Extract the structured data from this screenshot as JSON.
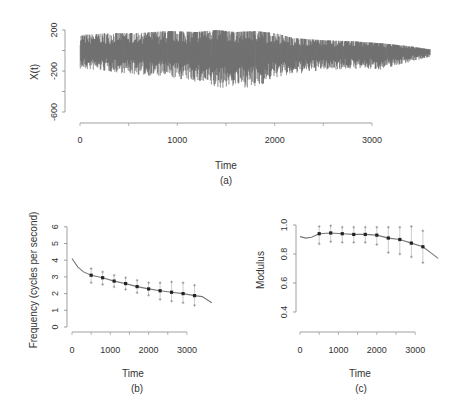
{
  "chart_data": [
    {
      "id": "a",
      "type": "line",
      "caption": "(a)",
      "xlabel": "Time",
      "ylabel": "X(t)",
      "xticks": [
        0,
        1000,
        2000,
        3000
      ],
      "yticks": [
        200,
        -200,
        -600
      ],
      "xlim": [
        0,
        3600
      ],
      "ylim": [
        -650,
        250
      ],
      "description": "Dense oscillating time series, roughly centered near 0, amplitude about ±200 with spikes down to about -500 around t=1400-1800, amplitude shrinking after t=2500",
      "envelope": {
        "x": [
          0,
          300,
          600,
          900,
          1200,
          1400,
          1600,
          1800,
          2000,
          2200,
          2500,
          2800,
          3100,
          3400,
          3600
        ],
        "upper": [
          150,
          170,
          170,
          190,
          180,
          200,
          180,
          190,
          170,
          120,
          100,
          90,
          70,
          40,
          10
        ],
        "lower": [
          -200,
          -230,
          -280,
          -300,
          -380,
          -470,
          -440,
          -470,
          -320,
          -300,
          -240,
          -230,
          -250,
          -150,
          -90
        ]
      }
    },
    {
      "id": "b",
      "type": "line",
      "caption": "(b)",
      "xlabel": "Time",
      "ylabel": "Frequency (cycles per second)",
      "xticks": [
        0,
        1000,
        2000,
        3000
      ],
      "yticks": [
        0,
        1,
        2,
        3,
        4,
        5,
        6
      ],
      "xlim": [
        0,
        3650
      ],
      "ylim": [
        0,
        6
      ],
      "curve": {
        "x": [
          0,
          150,
          300,
          500,
          800,
          1100,
          1400,
          1700,
          2000,
          2300,
          2600,
          2900,
          3200,
          3400,
          3650
        ],
        "y": [
          4.1,
          3.6,
          3.3,
          3.1,
          2.95,
          2.75,
          2.6,
          2.42,
          2.28,
          2.17,
          2.08,
          2.0,
          1.88,
          1.82,
          1.45
        ]
      },
      "points": {
        "x": [
          500,
          800,
          1100,
          1400,
          1700,
          2000,
          2300,
          2600,
          2900,
          3200
        ],
        "y": [
          3.1,
          2.95,
          2.75,
          2.6,
          2.42,
          2.28,
          2.17,
          2.08,
          2.0,
          1.88
        ],
        "upper": [
          3.5,
          3.3,
          3.1,
          2.95,
          2.8,
          2.65,
          2.65,
          2.7,
          2.65,
          2.5
        ],
        "lower": [
          2.65,
          2.55,
          2.4,
          2.25,
          2.05,
          1.9,
          1.65,
          1.55,
          1.45,
          1.3
        ]
      }
    },
    {
      "id": "c",
      "type": "line",
      "caption": "(c)",
      "xlabel": "Time",
      "ylabel": "Modulus",
      "xticks": [
        0,
        1000,
        2000,
        3000
      ],
      "yticks": [
        0.4,
        0.6,
        0.8,
        1.0
      ],
      "ytick_labels": [
        "0.4",
        "0.6",
        "0.8",
        "1.0"
      ],
      "xlim": [
        0,
        3600
      ],
      "ylim": [
        0.4,
        1.0
      ],
      "curve": {
        "x": [
          0,
          150,
          300,
          500,
          800,
          1100,
          1400,
          1700,
          2000,
          2300,
          2600,
          2900,
          3200,
          3400,
          3600
        ],
        "y": [
          0.92,
          0.91,
          0.915,
          0.94,
          0.945,
          0.94,
          0.935,
          0.935,
          0.93,
          0.91,
          0.9,
          0.875,
          0.85,
          0.81,
          0.77
        ]
      },
      "points": {
        "x": [
          500,
          800,
          1100,
          1400,
          1700,
          2000,
          2300,
          2600,
          2900,
          3200
        ],
        "y": [
          0.94,
          0.945,
          0.94,
          0.935,
          0.935,
          0.93,
          0.91,
          0.9,
          0.875,
          0.85
        ],
        "upper": [
          0.99,
          0.995,
          0.985,
          0.985,
          0.985,
          0.985,
          0.985,
          0.985,
          0.99,
          0.96
        ],
        "lower": [
          0.87,
          0.885,
          0.88,
          0.88,
          0.88,
          0.865,
          0.81,
          0.8,
          0.78,
          0.74
        ]
      }
    }
  ]
}
